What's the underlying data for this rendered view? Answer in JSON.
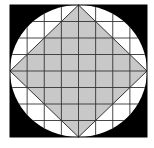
{
  "diagram": {
    "type": "geometry",
    "grid": {
      "rows": 8,
      "cols": 8
    },
    "colors": {
      "background": "#ffffff",
      "square_fill": "#000000",
      "circle_fill": "#ffffff",
      "diamond_fill": "#c8c8c8",
      "grid_line": "#333333"
    }
  }
}
